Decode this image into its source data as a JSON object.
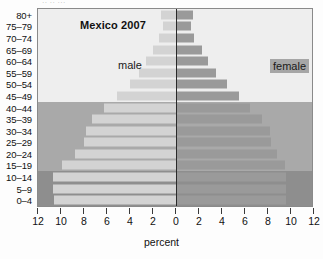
{
  "scan_artifact": "·· ·· ···",
  "chart_data": {
    "type": "bar",
    "subtype": "population-pyramid",
    "title": "Mexico 2007",
    "xlabel": "percent",
    "ylabel": "",
    "categories": [
      "0–4",
      "5–9",
      "10–14",
      "15–19",
      "20–24",
      "25–29",
      "30–34",
      "35–39",
      "40–44",
      "45–49",
      "50–54",
      "55–59",
      "60–64",
      "65–69",
      "70–74",
      "75–79",
      "80+"
    ],
    "series": [
      {
        "name": "male",
        "values": [
          10.6,
          10.7,
          10.7,
          9.9,
          8.8,
          8.0,
          7.8,
          7.3,
          6.3,
          5.1,
          4.0,
          3.2,
          2.6,
          2.0,
          1.5,
          1.1,
          1.3
        ]
      },
      {
        "name": "female",
        "values": [
          9.6,
          9.6,
          9.6,
          9.5,
          8.8,
          8.3,
          8.2,
          7.5,
          6.4,
          5.5,
          4.4,
          3.5,
          2.8,
          2.3,
          1.6,
          1.3,
          1.5
        ]
      }
    ],
    "xticks": [
      12,
      10,
      8,
      6,
      4,
      2,
      0,
      2,
      4,
      6,
      8,
      10,
      12
    ],
    "xlim": [
      -12,
      12
    ],
    "grid": false,
    "legend_position": "in-plot",
    "legend_labels": [
      "male",
      "female"
    ],
    "bands": [
      {
        "name": "children-band",
        "from": "0–4",
        "to": "10–14",
        "color": "#8e8e8e"
      },
      {
        "name": "working-band",
        "from": "15–19",
        "to": "40–44",
        "color": "#a9a9a9"
      },
      {
        "name": "older-band",
        "from": "45–49",
        "to": "80+",
        "color": "#eeeeee"
      }
    ],
    "colors": {
      "male_bar": "#d3d3d3",
      "female_bar": "#9a9a9a",
      "zero_axis": "#2a2a2a",
      "frame": "#8a8a8a"
    }
  }
}
